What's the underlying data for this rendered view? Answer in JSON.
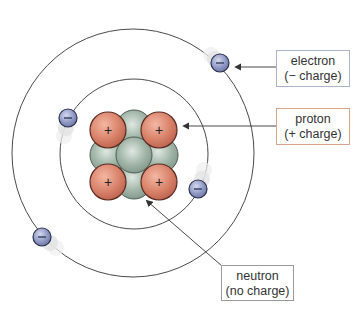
{
  "diagram": {
    "colors": {
      "orbit": "#4a4a4a",
      "proton_fill": "#d9826a",
      "proton_stroke": "#5a2a20",
      "neutron_fill": "#9fb3a6",
      "neutron_stroke": "#4e5e55",
      "electron_fill": "#8e98c4",
      "electron_stroke": "#2d3350",
      "electron_box_border": "#a9b4cc",
      "proton_box_border": "#d9a38f",
      "neutron_box_border": "#9a9a9a",
      "arrow": "#333333"
    },
    "symbols": {
      "proton": "+",
      "electron": "−"
    },
    "labels": {
      "electron": {
        "line1": "electron",
        "line2": "(− charge)"
      },
      "proton": {
        "line1": "proton",
        "line2": "(+ charge)"
      },
      "neutron": {
        "line1": "neutron",
        "line2": "(no charge)"
      }
    },
    "counts": {
      "protons": 4,
      "neutrons": 5,
      "electrons": 4,
      "orbits": 2
    }
  }
}
